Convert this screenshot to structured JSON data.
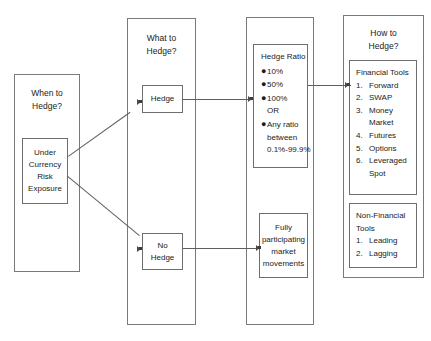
{
  "diagram": {
    "columns": [
      {
        "id": "when",
        "header": [
          "When to",
          "Hedge?"
        ],
        "node": {
          "lines": [
            "Under",
            "Currency",
            "Risk",
            "Exposure"
          ]
        }
      },
      {
        "id": "what",
        "header": [
          "What to",
          "Hedge?"
        ],
        "node_hedge": {
          "lines": [
            "Hedge"
          ]
        },
        "node_no_hedge": {
          "lines": [
            "No",
            "Hedge"
          ]
        }
      },
      {
        "id": "ratio",
        "header": [],
        "ratio_box": {
          "title": "Hedge Ratio",
          "items": [
            {
              "bullet": true,
              "text": "10%"
            },
            {
              "bullet": true,
              "text": "50%"
            },
            {
              "bullet": true,
              "text": "100%"
            },
            {
              "bullet": false,
              "text": "OR"
            },
            {
              "bullet": true,
              "text": "Any ratio"
            },
            {
              "bullet": false,
              "text": "between"
            },
            {
              "bullet": false,
              "text": "0.1%-99.9%"
            }
          ]
        },
        "outcome_box": {
          "lines": [
            "Fully",
            "participating",
            "market",
            "movements"
          ]
        }
      },
      {
        "id": "how",
        "header": [
          "How to",
          "Hedge?"
        ],
        "financial_tools": {
          "title": [
            "Financial Tools"
          ],
          "items": [
            {
              "num": "1.",
              "text": "Forward",
              "cont": ""
            },
            {
              "num": "2.",
              "text": "SWAP",
              "cont": ""
            },
            {
              "num": "3.",
              "text": "Money",
              "cont": "Market"
            },
            {
              "num": "4.",
              "text": "Futures",
              "cont": ""
            },
            {
              "num": "5.",
              "text": "Options",
              "cont": ""
            },
            {
              "num": "6.",
              "text": "Leveraged",
              "cont": "Spot"
            }
          ]
        },
        "non_financial_tools": {
          "title": [
            "Non-Financial",
            "Tools"
          ],
          "items": [
            {
              "num": "1.",
              "text": "Leading",
              "cont": ""
            },
            {
              "num": "2.",
              "text": "Lagging",
              "cont": ""
            }
          ]
        }
      }
    ],
    "bullet_glyph": "●",
    "colors": {
      "border": "#6e6e6e",
      "connector": "#5f5f5f",
      "text": "#1b1b1b",
      "background": "#ffffff"
    }
  }
}
